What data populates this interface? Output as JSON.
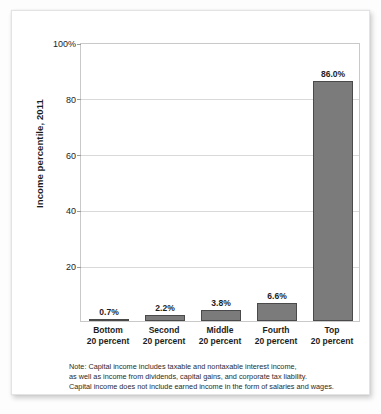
{
  "figure": {
    "y_axis_title": "Income percentile, 2011",
    "footnote_lines": [
      "Note: Capital income includes taxable and nontaxable interest income,",
      "as well as income from dividends, capital gains, and corporate tax liability.",
      "Capital income does not include earned income in the form of salaries and wages."
    ]
  },
  "colors": {
    "bar_fill": "#7b7b7b",
    "bar_border": "#4a4a4a",
    "gridline": "#d9d9d9",
    "axis": "#c9c9c9",
    "text": "#1d1d1d",
    "card_background": "#ffffff",
    "page_background": "#fdfdfd"
  },
  "chart_data": {
    "type": "bar",
    "title": "",
    "xlabel": "",
    "ylabel": "Income percentile, 2011",
    "ylim": [
      0,
      100
    ],
    "grid": true,
    "legend": "none",
    "categories": [
      "Bottom\n20 percent",
      "Second\n20 percent",
      "Middle\n20 percent",
      "Fourth\n20 percent",
      "Top\n20 percent"
    ],
    "category_lines": [
      {
        "line1": "Bottom",
        "line2": "20 percent"
      },
      {
        "line1": "Second",
        "line2": "20 percent"
      },
      {
        "line1": "Middle",
        "line2": "20 percent"
      },
      {
        "line1": "Fourth",
        "line2": "20 percent"
      },
      {
        "line1": "Top",
        "line2": "20 percent"
      }
    ],
    "values": [
      0.7,
      2.2,
      3.8,
      6.6,
      86.0
    ],
    "value_labels": [
      "0.7%",
      "2.2%",
      "3.8%",
      "6.6%",
      "86.0%"
    ],
    "ytick_values": [
      20,
      40,
      60,
      80,
      100
    ],
    "ytick_labels": [
      "20",
      "40",
      "60",
      "80",
      "100%"
    ]
  }
}
